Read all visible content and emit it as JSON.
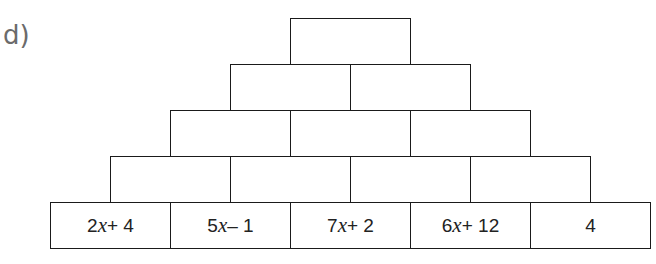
{
  "label": "d)",
  "pyramid": {
    "rows": [
      {
        "cells": [
          ""
        ]
      },
      {
        "cells": [
          "",
          ""
        ]
      },
      {
        "cells": [
          "",
          "",
          ""
        ]
      },
      {
        "cells": [
          "",
          "",
          "",
          ""
        ]
      },
      {
        "cells": [
          "2x + 4",
          "5x – 1",
          "7x + 2",
          "6x + 12",
          "4"
        ]
      }
    ]
  }
}
